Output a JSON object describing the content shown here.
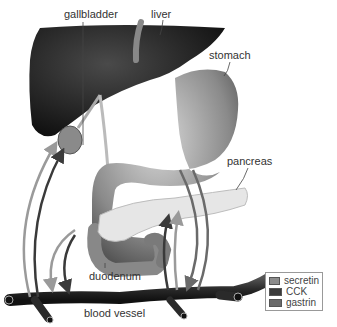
{
  "labels": {
    "gallbladder": "gallbladder",
    "liver": "liver",
    "stomach": "stomach",
    "pancreas": "pancreas",
    "duodenum": "duodenum",
    "blood_vessel": "blood vessel"
  },
  "legend": [
    {
      "label": "secretin",
      "color": "#8c8c8c"
    },
    {
      "label": "CCK",
      "color": "#3a3a3a"
    },
    {
      "label": "gastrin",
      "color": "#6a6a6a"
    }
  ]
}
